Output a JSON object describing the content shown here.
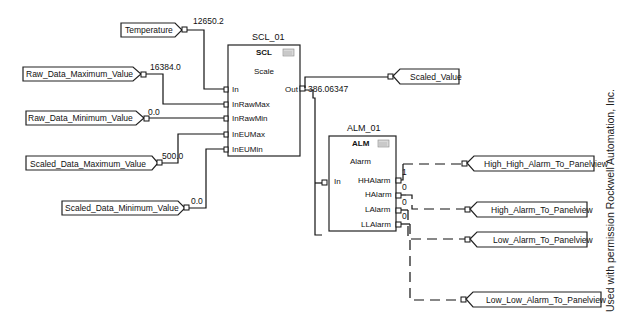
{
  "input_tags": [
    {
      "id": "temperature",
      "label": "Temperature",
      "value": "12650.2"
    },
    {
      "id": "raw-max",
      "label": "Raw_Data_Maximum_Value",
      "value": "16384.0"
    },
    {
      "id": "raw-min",
      "label": "Raw_Data_Minimum_Value",
      "value": "0.0"
    },
    {
      "id": "scaled-max",
      "label": "Scaled_Data_Maximum_Value",
      "value": "500.0"
    },
    {
      "id": "scaled-min",
      "label": "Scaled_Data_Minimum_Value",
      "value": "0.0"
    }
  ],
  "scl_block": {
    "name": "SCL_01",
    "type": "SCL",
    "description": "Scale",
    "inputs": [
      "In",
      "InRawMax",
      "InRawMin",
      "InEUMax",
      "InEUMin"
    ],
    "output": "Out",
    "output_value": "386.06347"
  },
  "scaled_output_tag": {
    "label": "Scaled_Value"
  },
  "alm_block": {
    "name": "ALM_01",
    "type": "ALM",
    "description": "Alarm",
    "input": "In",
    "outputs": [
      {
        "label": "HHAlarm",
        "value": "1"
      },
      {
        "label": "HAlarm",
        "value": "0"
      },
      {
        "label": "LAlarm",
        "value": "0"
      },
      {
        "label": "LLAlarm",
        "value": "0"
      }
    ]
  },
  "output_tags": [
    {
      "label": "High_High_Alarm_To_Panelview"
    },
    {
      "label": "High_Alarm_To_Panelview"
    },
    {
      "label": "Low_Alarm_To_Panelview"
    },
    {
      "label": "Low_Low_Alarm_To_Panelview"
    }
  ],
  "credit": "Used with permission Rockwell Automation, Inc."
}
